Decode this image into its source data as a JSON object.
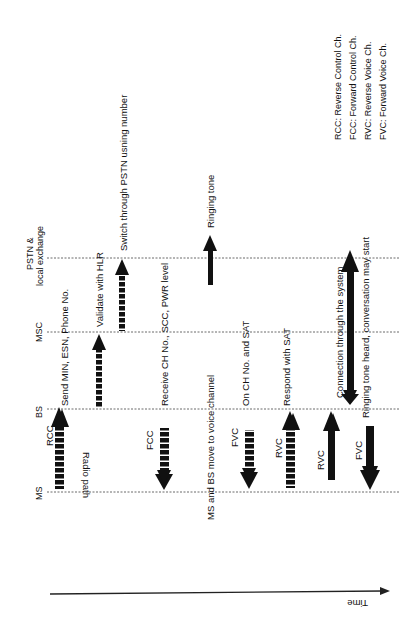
{
  "diagram": {
    "type": "sequence",
    "orientation": "rotated-90-ccw",
    "entities": [
      {
        "id": "ms",
        "label": "MS"
      },
      {
        "id": "bs",
        "label": "BS"
      },
      {
        "id": "msc",
        "label": "MSC"
      },
      {
        "id": "pstn",
        "label_line1": "PSTN &",
        "label_line2": "local exchange"
      }
    ],
    "radio_path_label": "Radio path",
    "time_label": "Time",
    "messages": [
      {
        "channel": "RCC",
        "text": "Send MIN, ESN, Phone No."
      },
      {
        "channel": "",
        "text": "Validate with HLR"
      },
      {
        "channel": "",
        "text": "Switch through PSTN usning number"
      },
      {
        "channel": "FCC",
        "text": "Receive CH No., SCC, PWR level"
      },
      {
        "channel": "",
        "text": "Ringing tone"
      },
      {
        "channel": "",
        "text": "MS and BS move to voice channel"
      },
      {
        "channel": "FVC",
        "text": "On CH  No.  and  SAT"
      },
      {
        "channel": "RVC",
        "text": "Respond with  SAT"
      },
      {
        "channel": "RVC",
        "text": "Connection through the system"
      },
      {
        "channel": "FVC",
        "text": "Ringing tone heard, conversation may start"
      }
    ],
    "legend": [
      "RCC: Reverse Control Ch.",
      "FCC: Forward Control Ch.",
      "RVC: Reverse Voice Ch.",
      "FVC: Forward Voice Ch."
    ]
  }
}
